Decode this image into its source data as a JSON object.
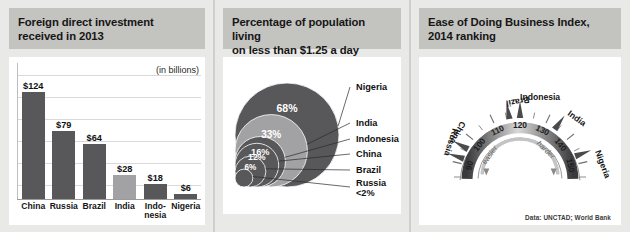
{
  "panels": {
    "fdi": {
      "title": "Foreign direct investment\nreceived in 2013",
      "title_line1": "Foreign direct investment",
      "title_line2": "received in 2013",
      "units_note": "(in billions)"
    },
    "poverty": {
      "title_line1": "Percentage of population living",
      "title_line2": "on less than $1.25 a day"
    },
    "business": {
      "title_line1": "Ease of Doing Business Index,",
      "title_line2": "2014 ranking",
      "easier_label": "easier",
      "harder_label": "harder"
    }
  },
  "credit": "Data: UNCTAD; World Bank",
  "colors": {
    "dark_gray": "#58585a",
    "light_gray": "#a2a2a4",
    "header_band": "#c3c3c0",
    "page_bg": "#e9e9e7",
    "plot_bg": "#ffffff"
  },
  "chart_data": [
    {
      "type": "bar",
      "title": "Foreign direct investment received in 2013",
      "xlabel": "",
      "ylabel": "",
      "units": "(in billions)",
      "ylim": [
        0,
        135
      ],
      "grid": true,
      "categories": [
        "China",
        "Russia",
        "Brazil",
        "India",
        "Indo-\nnesia",
        "Nigeria"
      ],
      "category_labels": [
        "China",
        "Russia",
        "Brazil",
        "India",
        "Indo-nesia",
        "Nigeria"
      ],
      "values": [
        124,
        79,
        64,
        28,
        18,
        6
      ],
      "value_labels": [
        "$124",
        "$79",
        "$64",
        "$28",
        "$18",
        "$6"
      ],
      "bar_colors": [
        "#58585a",
        "#58585a",
        "#58585a",
        "#a2a2a4",
        "#58585a",
        "#58585a"
      ]
    },
    {
      "type": "bubble",
      "title": "Percentage of population living on less than $1.25 a day",
      "legend_position": "right",
      "categories": [
        "Nigeria",
        "India",
        "Indonesia",
        "China",
        "Brazil",
        "Russia"
      ],
      "values": [
        68,
        33,
        16,
        12,
        6,
        2
      ],
      "value_labels": [
        "68%",
        "33%",
        "16%",
        "12%",
        "6%",
        "<2%"
      ],
      "inside_labels": [
        "68%",
        "33%",
        "16%",
        "12%",
        "6%",
        ""
      ],
      "russia_label_line1": "Russia",
      "russia_label_line2": "<2%",
      "bubble_colors": [
        "#58585a",
        "#a2a2a4",
        "#58585a",
        "#58585a",
        "#58585a",
        "#58585a"
      ]
    },
    {
      "type": "gauge",
      "title": "Ease of Doing Business Index, 2014 ranking",
      "axis_min": 85,
      "axis_max": 155,
      "tick_labels": [
        "90",
        "100",
        "110",
        "120",
        "130",
        "140",
        "150"
      ],
      "tick_values": [
        90,
        100,
        110,
        120,
        130,
        140,
        150
      ],
      "direction_left": "easier",
      "direction_right": "harder",
      "categories": [
        "Russia",
        "China",
        "Brazil",
        "Indonesia",
        "India",
        "Nigeria"
      ],
      "values": [
        92,
        96,
        116,
        120,
        134,
        147
      ],
      "markers": [
        {
          "name": "Russia",
          "rank": 92
        },
        {
          "name": "China",
          "rank": 96
        },
        {
          "name": "Brazil",
          "rank": 116
        },
        {
          "name": "Indonesia",
          "rank": 120
        },
        {
          "name": "India",
          "rank": 134
        },
        {
          "name": "Nigeria",
          "rank": 147
        }
      ]
    }
  ]
}
